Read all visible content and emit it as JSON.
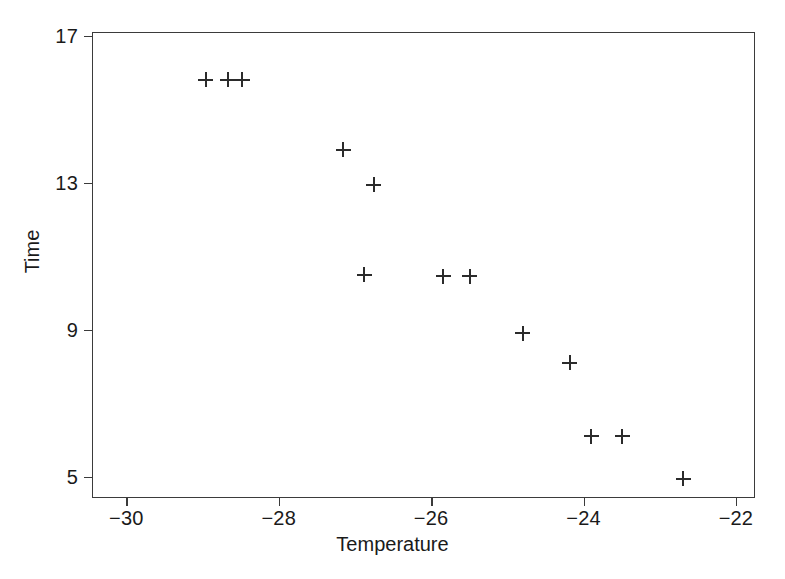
{
  "chart_data": {
    "type": "scatter",
    "title": "",
    "xlabel": "Temperature",
    "ylabel": "Time",
    "xlim": [
      -30.45,
      -21.75
    ],
    "ylim": [
      4.42,
      17.1
    ],
    "xticks": [
      -30,
      -28,
      -26,
      -24,
      -22
    ],
    "xticklabels": [
      "−30",
      "−28",
      "−26",
      "−24",
      "−22"
    ],
    "yticks": [
      5,
      9,
      13,
      17
    ],
    "yticklabels": [
      "5",
      "9",
      "13",
      "17"
    ],
    "grid": false,
    "legend": null,
    "marker": "plus",
    "marker_color": "#2b2b2b",
    "frame_color": "#3b3b3b",
    "background": "#ffffff",
    "points": [
      {
        "x": -28.96,
        "y": 15.8
      },
      {
        "x": -28.67,
        "y": 15.8
      },
      {
        "x": -28.48,
        "y": 15.8
      },
      {
        "x": -27.15,
        "y": 13.9
      },
      {
        "x": -26.75,
        "y": 12.95
      },
      {
        "x": -26.88,
        "y": 10.5
      },
      {
        "x": -25.84,
        "y": 10.45
      },
      {
        "x": -25.49,
        "y": 10.45
      },
      {
        "x": -24.8,
        "y": 8.9
      },
      {
        "x": -24.18,
        "y": 8.1
      },
      {
        "x": -23.9,
        "y": 6.1
      },
      {
        "x": -23.49,
        "y": 6.1
      },
      {
        "x": -22.69,
        "y": 4.95
      }
    ]
  },
  "figure": {
    "xlabel": "Temperature",
    "ylabel": "Time"
  }
}
